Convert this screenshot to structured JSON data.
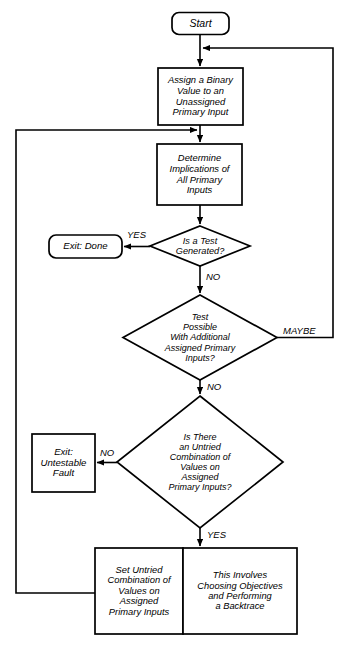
{
  "diagram": {
    "colors": {
      "stroke": "#000000",
      "fill": "#ffffff",
      "text": "#000000"
    },
    "nodes": {
      "start": {
        "label": "Start",
        "shape": "rounded-rectangle"
      },
      "assign_binary": {
        "label": "Assign a Binary\nValue to an\nUnassigned\nPrimary Input",
        "shape": "rectangle"
      },
      "determine_implications": {
        "label": "Determine\nImplications of\nAll Primary\nInputs",
        "shape": "rectangle"
      },
      "is_test_generated": {
        "label": "Is a Test\nGenerated?",
        "shape": "diamond"
      },
      "exit_done": {
        "label": "Exit: Done",
        "shape": "rounded-rectangle"
      },
      "test_possible": {
        "label": "Test\nPossible\nWith Additional\nAssigned Primary\nInputs?",
        "shape": "diamond"
      },
      "untried_combination": {
        "label": "Is There\nan Untried\nCombination of\nValues on\nAssigned\nPrimary Inputs?",
        "shape": "diamond"
      },
      "exit_untestable": {
        "label": "Exit:\nUntestable\nFault",
        "shape": "rectangle"
      },
      "set_untried": {
        "label": "Set Untried\nCombination of\nValues on\nAssigned\nPrimary  Inputs",
        "shape": "rectangle"
      },
      "backtrace_note": {
        "label": "This Involves\nChoosing Objectives\nand Performing\na Backtrace",
        "shape": "rectangle"
      }
    },
    "edge_labels": {
      "yes_test_generated": "YES",
      "no_test_generated": "NO",
      "maybe_test_possible": "MAYBE",
      "no_test_possible": "NO",
      "no_untried": "NO",
      "yes_untried": "YES"
    }
  }
}
